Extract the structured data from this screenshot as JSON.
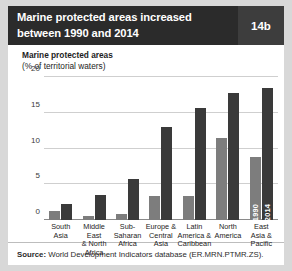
{
  "header": {
    "title_line1": "Marine protected areas increased",
    "title_line2": "between 1990 and 2014",
    "badge": "14b"
  },
  "axis_title": {
    "line1": "Marine protected areas",
    "line2": "(% of territorial waters)"
  },
  "footer": {
    "source_label": "Source:",
    "source_value": "World Development Indicators database (ER.MRN.PTMR.ZS)."
  },
  "colors": {
    "header_background": "#2b2b2b",
    "badge_background": "#3d3d3d",
    "series_1990": "#7d7d7d",
    "series_2014": "#3a3a3a",
    "gridline": "#cfcfcf"
  },
  "inline_labels": {
    "y1990": "1990",
    "y2014": "2014"
  },
  "chart_data": {
    "type": "bar",
    "title": "Marine protected areas increased between 1990 and 2014",
    "subtitle": "Marine protected areas (% of territorial waters)",
    "xlabel": "",
    "ylabel": "(% of territorial waters)",
    "ylim": [
      0,
      20
    ],
    "yticks": [
      0,
      5,
      10,
      15,
      20
    ],
    "ytick_labels": [
      "0",
      "5",
      "10",
      "15",
      "20"
    ],
    "grid": true,
    "legend": "in-bar labels on rightmost group",
    "categories": [
      "South Asia",
      "Middle East & North Africa",
      "Sub-Saharan Africa",
      "Europe & Central Asia",
      "Latin America & Caribbean",
      "North America",
      "East Asia & Pacific"
    ],
    "category_lines": [
      [
        "South",
        "Asia"
      ],
      [
        "Middle East",
        "& North",
        "Africa"
      ],
      [
        "Sub-",
        "Saharan",
        "Africa"
      ],
      [
        "Europe &",
        "Central",
        "Asia"
      ],
      [
        "Latin",
        "America &",
        "Caribbean"
      ],
      [
        "North",
        "America"
      ],
      [
        "East",
        "Asia &",
        "Pacific"
      ]
    ],
    "series": [
      {
        "name": "1990",
        "values": [
          1.3,
          0.5,
          0.8,
          3.3,
          3.4,
          11.5,
          8.8
        ]
      },
      {
        "name": "2014",
        "values": [
          2.3,
          3.5,
          5.8,
          13.0,
          15.7,
          17.8,
          18.5
        ]
      }
    ]
  }
}
